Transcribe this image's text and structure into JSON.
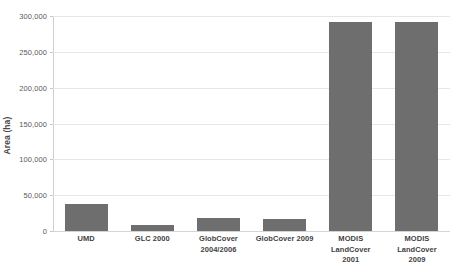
{
  "chart_data": {
    "type": "bar",
    "title": "",
    "subtitle": "",
    "xlabel": "",
    "ylabel": "Area (ha)",
    "categories": [
      "UMD",
      "GLC 2000",
      "GlobCover 2004/2006",
      "GlobCover 2009",
      "MODIS LandCover 2001",
      "MODIS LandCover 2009"
    ],
    "values": [
      38000,
      8000,
      17500,
      17000,
      292000,
      291000
    ],
    "ylim": [
      0,
      300000
    ],
    "ytick_values": [
      0,
      50000,
      100000,
      150000,
      200000,
      250000,
      300000
    ],
    "ytick_labels": [
      "0",
      "50,000",
      "100,000",
      "150,000",
      "200,000",
      "250,000",
      "300,000"
    ],
    "grid": true,
    "legend": false,
    "legend_position": "none",
    "bar_color": "#6e6e6e",
    "grid_color": "#e6e6e6",
    "background_color": "#ffffff",
    "series": [
      {
        "name": "Area (ha)",
        "values": [
          38000,
          8000,
          17500,
          17000,
          292000,
          291000
        ]
      }
    ]
  }
}
